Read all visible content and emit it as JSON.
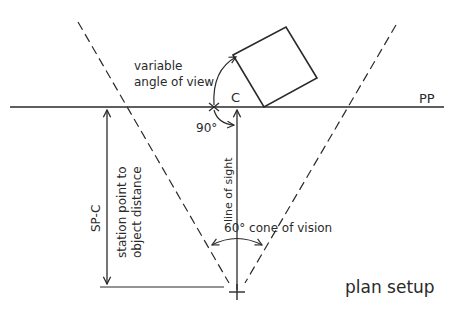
{
  "diagram": {
    "title": "plan setup",
    "labels": {
      "picture_plane": "PP",
      "center_of_vision": "C",
      "variable_angle_line1": "variable",
      "variable_angle_line2": "angle of view",
      "right_angle": "90°",
      "line_of_sight": "line of sight",
      "cone_of_vision": "60° cone of vision",
      "station_point_line1": "station point to",
      "station_point_line2": "object distance",
      "sp_c": "SP-C"
    },
    "colors": {
      "ink": "#2a2a2a",
      "background": "#ffffff"
    }
  }
}
